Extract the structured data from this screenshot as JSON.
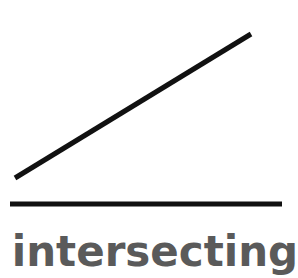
{
  "diagram": {
    "label": "intersecting",
    "label_color": "#5a5a5a",
    "line_color": "#111111",
    "lines": [
      {
        "name": "diagonal-line",
        "x1": 15,
        "y1": 178,
        "x2": 251,
        "y2": 34,
        "stroke_width": 5
      },
      {
        "name": "horizontal-line",
        "x1": 10,
        "y1": 204,
        "x2": 282,
        "y2": 204,
        "stroke_width": 5
      }
    ]
  }
}
